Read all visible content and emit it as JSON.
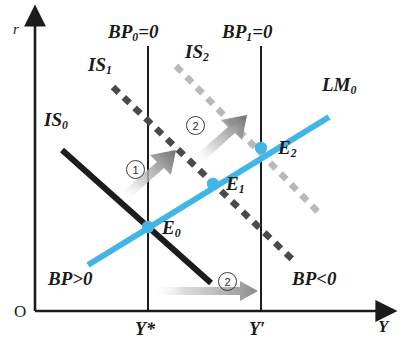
{
  "figure": {
    "type": "economics-diagram",
    "model": "IS-LM-BP Mundell-Fleming",
    "axes": {
      "origin_label": "O",
      "y_axis_label": "r",
      "x_axis_label": "Y"
    },
    "x_ticks": [
      {
        "label": "Y*",
        "x": 148
      },
      {
        "label": "Y′",
        "x": 261
      }
    ],
    "curves": [
      {
        "name": "IS0",
        "label": "IS",
        "sub": "0",
        "style": "solid",
        "color": "#1c1c1c"
      },
      {
        "name": "IS1",
        "label": "IS",
        "sub": "1",
        "style": "dashed",
        "color": "#4a4a4a"
      },
      {
        "name": "IS2",
        "label": "IS",
        "sub": "2",
        "style": "dashed",
        "color": "#b6b6b6"
      },
      {
        "name": "LM0",
        "label": "LM",
        "sub": "0",
        "style": "solid",
        "color": "#41b6e6"
      },
      {
        "name": "BP0",
        "label": "BP",
        "sub": "0",
        "suffix": "=0",
        "style": "vertical",
        "color": "#1c1c1c"
      },
      {
        "name": "BP1",
        "label": "BP",
        "sub": "1",
        "suffix": "=0",
        "style": "vertical",
        "color": "#1c1c1c"
      }
    ],
    "labels": {
      "is0": "IS",
      "is0_sub": "0",
      "is1": "IS",
      "is1_sub": "1",
      "is2": "IS",
      "is2_sub": "2",
      "lm0": "LM",
      "lm0_sub": "0",
      "bp0": "BP",
      "bp0_sub": "0",
      "bp0_suffix": "=0",
      "bp1": "BP",
      "bp1_sub": "1",
      "bp1_suffix": "=0",
      "bp_surplus": "BP>0",
      "bp_deficit": "BP<0"
    },
    "equilibria": [
      {
        "name": "E0",
        "label": "E",
        "sub": "0",
        "x": 148,
        "y": 227
      },
      {
        "name": "E1",
        "label": "E",
        "sub": "1",
        "x": 213,
        "y": 184
      },
      {
        "name": "E2",
        "label": "E",
        "sub": "2",
        "x": 261,
        "y": 148
      }
    ],
    "shift_markers": [
      {
        "id": "1",
        "text": "①",
        "number": "1"
      },
      {
        "id": "2a",
        "text": "②",
        "number": "2"
      },
      {
        "id": "2b",
        "text": "②",
        "number": "2"
      }
    ],
    "colors": {
      "lm_blue": "#41b6e6",
      "is_black": "#1c1c1c",
      "is1_gray": "#4a4a4a",
      "is2_light": "#b6b6b6",
      "axis": "#1c1c1c",
      "dot": "#41b6e6",
      "background": "#ffffff"
    }
  }
}
